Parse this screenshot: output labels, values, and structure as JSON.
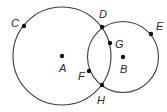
{
  "diagram": {
    "circles": [
      {
        "name": "circle-A",
        "center": "A",
        "cx": 62,
        "cy": 56,
        "r": 49
      },
      {
        "name": "circle-B",
        "center": "B",
        "cx": 123,
        "cy": 57,
        "r": 35.5
      }
    ],
    "points": {
      "A": {
        "label": "A",
        "x": 62,
        "y": 56,
        "lx": 59,
        "ly": 72
      },
      "B": {
        "label": "B",
        "x": 123,
        "y": 57,
        "lx": 120,
        "ly": 73
      },
      "C": {
        "label": "C",
        "x": 24,
        "y": 26,
        "lx": 11,
        "ly": 27
      },
      "D": {
        "label": "D",
        "x": 102,
        "y": 27,
        "lx": 99,
        "ly": 18
      },
      "E": {
        "label": "E",
        "x": 151,
        "y": 34,
        "lx": 156,
        "ly": 30
      },
      "F": {
        "label": "F",
        "x": 89,
        "y": 71,
        "lx": 78,
        "ly": 80
      },
      "G": {
        "label": "G",
        "x": 110,
        "y": 43,
        "lx": 115,
        "ly": 48
      },
      "H": {
        "label": "H",
        "x": 102,
        "y": 85,
        "lx": 97,
        "ly": 104
      }
    }
  }
}
